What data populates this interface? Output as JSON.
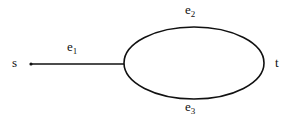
{
  "diagram": {
    "nodes": [
      {
        "id": "s",
        "label": "s"
      },
      {
        "id": "t",
        "label": "t"
      }
    ],
    "edges": [
      {
        "id": "e1",
        "base": "e",
        "sub": "1",
        "from": "s",
        "to": "junction"
      },
      {
        "id": "e2",
        "base": "e",
        "sub": "2",
        "from": "junction",
        "to": "t",
        "path": "upper arc"
      },
      {
        "id": "e3",
        "base": "e",
        "sub": "3",
        "from": "junction",
        "to": "t",
        "path": "lower arc"
      }
    ],
    "colors": {
      "stroke": "#111111",
      "background": "#ffffff"
    }
  }
}
